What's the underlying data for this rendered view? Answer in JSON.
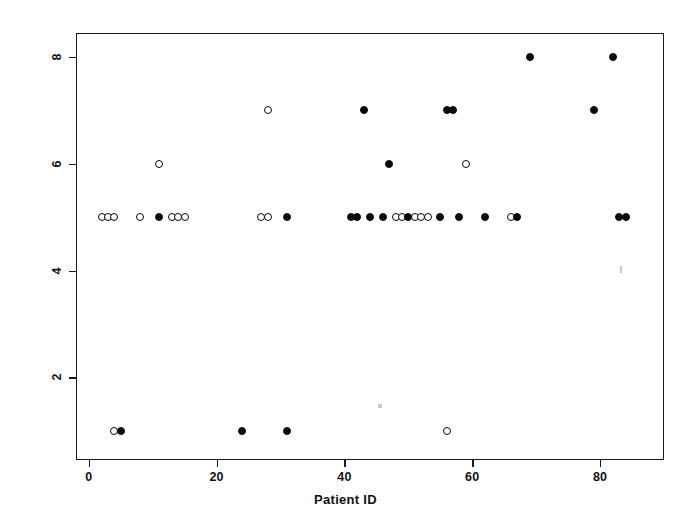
{
  "chart_data": {
    "type": "scatter",
    "title": "",
    "xlabel": "Patient ID",
    "ylabel": "Type Classification",
    "xlim": [
      -2,
      90
    ],
    "ylim": [
      0.45,
      8.45
    ],
    "xticks": [
      0,
      20,
      40,
      60,
      80
    ],
    "yticks": [
      2,
      4,
      6,
      8
    ],
    "grid": false,
    "legend": null,
    "marker_styles": {
      "open": {
        "name": "open-circle",
        "fill": "#ffffff",
        "stroke": "#0a0a0a"
      },
      "filled": {
        "name": "filled-circle",
        "fill": "#0a0a0a",
        "stroke": "#0a0a0a"
      }
    },
    "series": [
      {
        "name": "Open circles",
        "marker": "open",
        "points": [
          {
            "x": 2,
            "y": 5
          },
          {
            "x": 3,
            "y": 5
          },
          {
            "x": 4,
            "y": 5
          },
          {
            "x": 4,
            "y": 1
          },
          {
            "x": 8,
            "y": 5
          },
          {
            "x": 11,
            "y": 6
          },
          {
            "x": 13,
            "y": 5
          },
          {
            "x": 14,
            "y": 5
          },
          {
            "x": 15,
            "y": 5
          },
          {
            "x": 27,
            "y": 5
          },
          {
            "x": 28,
            "y": 5
          },
          {
            "x": 28,
            "y": 7
          },
          {
            "x": 48,
            "y": 5
          },
          {
            "x": 49,
            "y": 5
          },
          {
            "x": 51,
            "y": 5
          },
          {
            "x": 52,
            "y": 5
          },
          {
            "x": 53,
            "y": 5
          },
          {
            "x": 56,
            "y": 1
          },
          {
            "x": 59,
            "y": 6
          },
          {
            "x": 66,
            "y": 5
          }
        ]
      },
      {
        "name": "Filled circles",
        "marker": "filled",
        "points": [
          {
            "x": 5,
            "y": 1
          },
          {
            "x": 11,
            "y": 5
          },
          {
            "x": 24,
            "y": 1
          },
          {
            "x": 31,
            "y": 1
          },
          {
            "x": 31,
            "y": 5
          },
          {
            "x": 41,
            "y": 5
          },
          {
            "x": 42,
            "y": 5
          },
          {
            "x": 43,
            "y": 7
          },
          {
            "x": 44,
            "y": 5
          },
          {
            "x": 46,
            "y": 5
          },
          {
            "x": 47,
            "y": 6
          },
          {
            "x": 50,
            "y": 5
          },
          {
            "x": 55,
            "y": 5
          },
          {
            "x": 56,
            "y": 7
          },
          {
            "x": 57,
            "y": 7
          },
          {
            "x": 58,
            "y": 5
          },
          {
            "x": 62,
            "y": 5
          },
          {
            "x": 67,
            "y": 5
          },
          {
            "x": 69,
            "y": 8
          },
          {
            "x": 79,
            "y": 7
          },
          {
            "x": 82,
            "y": 8
          },
          {
            "x": 83,
            "y": 5
          },
          {
            "x": 84,
            "y": 5
          }
        ]
      }
    ]
  }
}
